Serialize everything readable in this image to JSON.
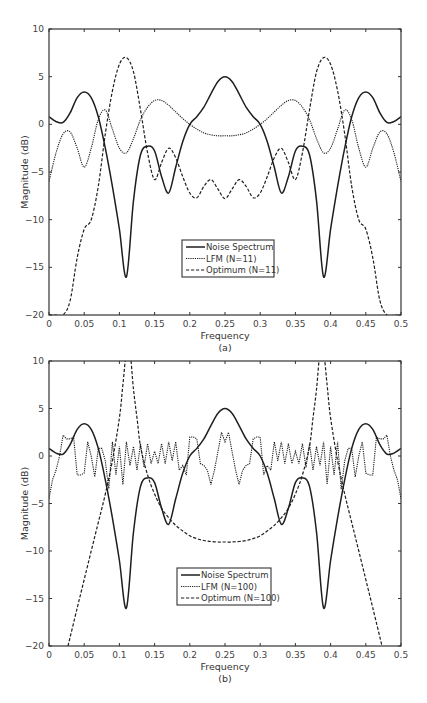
{
  "chart_data": [
    {
      "type": "line",
      "panel": "(a)",
      "xlabel": "Frequency",
      "ylabel": "Magnitude (dB)",
      "caption": "(a)",
      "xlim": [
        0,
        0.5
      ],
      "ylim": [
        -20,
        10
      ],
      "xticks": [
        "0",
        "0.05",
        "0.1",
        "0.15",
        "0.2",
        "0.25",
        "0.3",
        "0.35",
        "0.4",
        "0.45",
        "0.5"
      ],
      "yticks": [
        "10",
        "5",
        "0",
        "-5",
        "-10",
        "-15",
        "-20"
      ],
      "grid": false,
      "legend_position": "lower center",
      "series": [
        {
          "name": "Noise Spectrum",
          "style": "solid",
          "x": [
            0,
            0.01,
            0.02,
            0.03,
            0.04,
            0.05,
            0.06,
            0.07,
            0.08,
            0.09,
            0.1,
            0.11,
            0.12,
            0.13,
            0.14,
            0.15,
            0.16,
            0.17,
            0.18,
            0.19,
            0.2,
            0.21,
            0.22,
            0.23,
            0.24,
            0.25,
            0.26,
            0.27,
            0.28,
            0.29,
            0.3,
            0.31,
            0.32,
            0.33,
            0.34,
            0.35,
            0.36,
            0.37,
            0.38,
            0.39,
            0.4,
            0.41,
            0.42,
            0.43,
            0.44,
            0.45,
            0.46,
            0.47,
            0.48,
            0.49,
            0.5
          ],
          "y": [
            0.8,
            0.3,
            0.2,
            1.2,
            2.8,
            3.4,
            2.8,
            0.8,
            -2.5,
            -6.5,
            -11,
            -16,
            -8,
            -3.2,
            -2.3,
            -2.8,
            -5.5,
            -7.2,
            -4.5,
            -1.8,
            0,
            0.8,
            1.8,
            3.2,
            4.5,
            5,
            4.5,
            3.2,
            1.8,
            0.8,
            0,
            -1.8,
            -4.5,
            -7.2,
            -5.5,
            -2.8,
            -2.3,
            -3.2,
            -8,
            -16,
            -11,
            -6.5,
            -2.5,
            0.8,
            2.8,
            3.4,
            2.8,
            1.2,
            0.2,
            0.3,
            0.8
          ]
        },
        {
          "name": "LFM (N=11)",
          "style": "dotted",
          "x": [
            0,
            0.01,
            0.02,
            0.03,
            0.04,
            0.05,
            0.06,
            0.07,
            0.08,
            0.09,
            0.1,
            0.11,
            0.12,
            0.13,
            0.14,
            0.15,
            0.16,
            0.17,
            0.18,
            0.19,
            0.2,
            0.21,
            0.22,
            0.23,
            0.24,
            0.25,
            0.26,
            0.27,
            0.28,
            0.29,
            0.3,
            0.31,
            0.32,
            0.33,
            0.34,
            0.35,
            0.36,
            0.37,
            0.38,
            0.39,
            0.4,
            0.41,
            0.42,
            0.43,
            0.44,
            0.45,
            0.46,
            0.47,
            0.48,
            0.49,
            0.5
          ],
          "y": [
            -6,
            -3,
            -1,
            -0.8,
            -2.5,
            -4.5,
            -2.5,
            0.5,
            1.5,
            -0.5,
            -2.5,
            -3,
            -1.5,
            0.5,
            1.8,
            2.5,
            2.5,
            2,
            1.3,
            0.6,
            0,
            -0.5,
            -0.9,
            -1.1,
            -1.2,
            -1.2,
            -1.2,
            -1.1,
            -0.9,
            -0.5,
            0,
            0.6,
            1.3,
            2,
            2.5,
            2.5,
            1.8,
            0.5,
            -1.5,
            -3,
            -2.5,
            -0.5,
            1.5,
            0.5,
            -2.5,
            -4.5,
            -2.5,
            -0.8,
            -1,
            -3,
            -6
          ]
        },
        {
          "name": "Optimum (N=11)",
          "style": "dashed",
          "x": [
            0,
            0.01,
            0.02,
            0.03,
            0.04,
            0.05,
            0.06,
            0.07,
            0.08,
            0.09,
            0.1,
            0.11,
            0.12,
            0.13,
            0.14,
            0.15,
            0.16,
            0.17,
            0.18,
            0.19,
            0.2,
            0.21,
            0.22,
            0.23,
            0.24,
            0.25,
            0.26,
            0.27,
            0.28,
            0.29,
            0.3,
            0.31,
            0.32,
            0.33,
            0.34,
            0.35,
            0.36,
            0.37,
            0.38,
            0.39,
            0.4,
            0.41,
            0.42,
            0.43,
            0.44,
            0.45,
            0.46,
            0.47,
            0.48,
            0.49,
            0.5
          ],
          "y": [
            -20,
            -20,
            -20,
            -18.5,
            -14,
            -11,
            -10,
            -6.5,
            -1,
            3.5,
            6.3,
            7,
            5.5,
            1.5,
            -3,
            -5.8,
            -4,
            -2.5,
            -3.5,
            -5.5,
            -7.2,
            -7.7,
            -6.5,
            -5.8,
            -6.8,
            -7.8,
            -6.8,
            -5.8,
            -6.5,
            -7.7,
            -7.2,
            -5.5,
            -3.5,
            -2.5,
            -4,
            -5.8,
            -3,
            1.5,
            5.5,
            7,
            6.3,
            3.5,
            -1,
            -6.5,
            -10,
            -11,
            -14,
            -18.5,
            -20,
            -20,
            -20
          ]
        }
      ]
    },
    {
      "type": "line",
      "panel": "(b)",
      "xlabel": "Frequency",
      "ylabel": "Magnitude (dB)",
      "caption": "(b)",
      "xlim": [
        0,
        0.5
      ],
      "ylim": [
        -20,
        10
      ],
      "xticks": [
        "0",
        "0.05",
        "0.1",
        "0.15",
        "0.2",
        "0.25",
        "0.3",
        "0.35",
        "0.4",
        "0.45",
        "0.5"
      ],
      "yticks": [
        "10",
        "5",
        "0",
        "-5",
        "-10",
        "-15",
        "-20"
      ],
      "grid": false,
      "legend_position": "lower center",
      "series": [
        {
          "name": "Noise Spectrum",
          "style": "solid",
          "x": [
            0,
            0.01,
            0.02,
            0.03,
            0.04,
            0.05,
            0.06,
            0.07,
            0.08,
            0.09,
            0.1,
            0.11,
            0.12,
            0.13,
            0.14,
            0.15,
            0.16,
            0.17,
            0.18,
            0.19,
            0.2,
            0.21,
            0.22,
            0.23,
            0.24,
            0.25,
            0.26,
            0.27,
            0.28,
            0.29,
            0.3,
            0.31,
            0.32,
            0.33,
            0.34,
            0.35,
            0.36,
            0.37,
            0.38,
            0.39,
            0.4,
            0.41,
            0.42,
            0.43,
            0.44,
            0.45,
            0.46,
            0.47,
            0.48,
            0.49,
            0.5
          ],
          "y": [
            0.8,
            0.3,
            0.2,
            1.2,
            2.8,
            3.4,
            2.8,
            0.8,
            -2.5,
            -6.5,
            -11,
            -16,
            -8,
            -3.2,
            -2.3,
            -2.8,
            -5.5,
            -7.2,
            -4.5,
            -1.8,
            0,
            0.8,
            1.8,
            3.2,
            4.5,
            5,
            4.5,
            3.2,
            1.8,
            0.8,
            0,
            -1.8,
            -4.5,
            -7.2,
            -5.5,
            -2.8,
            -2.3,
            -3.2,
            -8,
            -16,
            -11,
            -6.5,
            -2.5,
            0.8,
            2.8,
            3.4,
            2.8,
            1.2,
            0.2,
            0.3,
            0.8
          ]
        },
        {
          "name": "LFM (N=100)",
          "style": "dotted",
          "x": [
            0,
            0.005,
            0.01,
            0.015,
            0.02,
            0.025,
            0.03,
            0.035,
            0.04,
            0.045,
            0.05,
            0.055,
            0.06,
            0.065,
            0.07,
            0.075,
            0.08,
            0.085,
            0.09,
            0.095,
            0.1,
            0.105,
            0.11,
            0.115,
            0.12,
            0.125,
            0.13,
            0.135,
            0.14,
            0.145,
            0.15,
            0.155,
            0.16,
            0.165,
            0.17,
            0.175,
            0.18,
            0.185,
            0.19,
            0.195,
            0.2,
            0.205,
            0.21,
            0.215,
            0.22,
            0.225,
            0.23,
            0.235,
            0.24,
            0.245,
            0.25,
            0.255,
            0.26,
            0.265,
            0.27,
            0.275,
            0.28,
            0.285,
            0.29,
            0.295,
            0.3,
            0.305,
            0.31,
            0.315,
            0.32,
            0.325,
            0.33,
            0.335,
            0.34,
            0.345,
            0.35,
            0.355,
            0.36,
            0.365,
            0.37,
            0.375,
            0.38,
            0.385,
            0.39,
            0.395,
            0.4,
            0.405,
            0.41,
            0.415,
            0.42,
            0.425,
            0.43,
            0.435,
            0.44,
            0.445,
            0.45,
            0.455,
            0.46,
            0.465,
            0.47,
            0.475,
            0.48,
            0.485,
            0.49,
            0.495,
            0.5
          ],
          "y": [
            -4.5,
            -2.5,
            -1.5,
            0,
            2.2,
            1.8,
            1.8,
            2,
            -2,
            -2,
            -1.8,
            1.5,
            0,
            -2.2,
            0.8,
            0.8,
            -0.5,
            -3.5,
            1.5,
            -2,
            1,
            -3,
            1.5,
            -1,
            1,
            -1.5,
            1.3,
            -1.2,
            1.3,
            -0.8,
            0.5,
            -0.8,
            1.3,
            -0.8,
            1.5,
            -0.5,
            1.5,
            -1.5,
            -1,
            -2,
            2,
            2,
            1.8,
            -0.8,
            -1,
            -1.5,
            -3,
            -1.5,
            0.5,
            2.5,
            1.5,
            2.5,
            0.5,
            -1.5,
            -3,
            -1.5,
            -1,
            -0.8,
            1.8,
            2,
            2,
            -2,
            -1,
            -1.5,
            1.5,
            -0.5,
            1.5,
            -0.8,
            1.3,
            -0.8,
            0.5,
            -0.8,
            1.3,
            -1.2,
            1.3,
            -1.5,
            1,
            -1,
            1.5,
            -3,
            1,
            -2,
            1.5,
            -3.5,
            -0.5,
            0.8,
            0.8,
            -2.2,
            0,
            1.5,
            -1.8,
            -2,
            -2,
            2,
            1.8,
            1.8,
            2.2,
            0,
            -1.5,
            -2.5,
            -4.5
          ]
        },
        {
          "name": "Optimum (N=100)",
          "style": "dashed",
          "x": [
            0.027,
            0.04,
            0.05,
            0.06,
            0.07,
            0.08,
            0.09,
            0.1,
            0.105,
            0.11,
            0.115,
            0.12,
            0.125,
            0.13,
            0.14,
            0.15,
            0.16,
            0.17,
            0.18,
            0.19,
            0.2,
            0.21,
            0.22,
            0.23,
            0.24,
            0.25,
            0.26,
            0.27,
            0.28,
            0.29,
            0.3,
            0.31,
            0.32,
            0.33,
            0.34,
            0.35,
            0.36,
            0.37,
            0.375,
            0.38,
            0.385,
            0.39,
            0.395,
            0.4,
            0.41,
            0.42,
            0.43,
            0.44,
            0.45,
            0.46,
            0.473
          ],
          "y": [
            -20,
            -16,
            -13,
            -10,
            -7,
            -4,
            -0.5,
            4,
            7.5,
            11,
            11,
            7,
            4,
            1,
            -2,
            -4,
            -5.5,
            -6.5,
            -7.3,
            -7.9,
            -8.4,
            -8.7,
            -8.9,
            -9,
            -9.05,
            -9.05,
            -9.05,
            -9,
            -8.9,
            -8.7,
            -8.4,
            -7.9,
            -7.3,
            -6.5,
            -5.5,
            -4,
            -2,
            1,
            4,
            7,
            11,
            11,
            7.5,
            4,
            -0.5,
            -4,
            -7,
            -10,
            -13,
            -16,
            -20
          ]
        }
      ]
    }
  ],
  "panels": [
    {
      "caption": "(a)",
      "xlabel": "Frequency",
      "ylabel": "Magnitude (dB)",
      "legend": [
        "Noise Spectrum",
        "LFM (N=11)",
        "Optimum (N=11)"
      ]
    },
    {
      "caption": "(b)",
      "xlabel": "Frequency",
      "ylabel": "Magnitude (dB)",
      "legend": [
        "Noise Spectrum",
        "LFM (N=100)",
        "Optimum (N=100)"
      ]
    }
  ],
  "colors": {
    "line": "#1e1e1e",
    "axis": "#333333",
    "text": "#444444"
  }
}
